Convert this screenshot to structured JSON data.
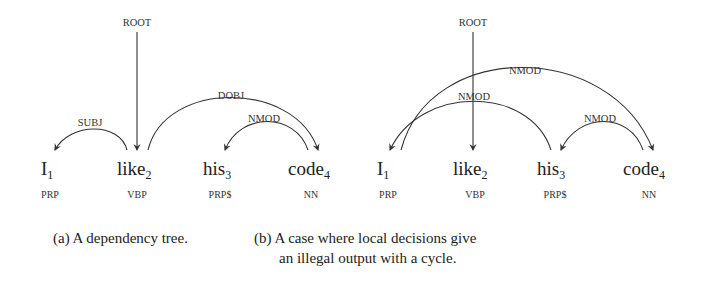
{
  "panel_a": {
    "root_label": "ROOT",
    "arcs": [
      {
        "label": "SUBJ",
        "from": "like",
        "to": "I"
      },
      {
        "label": "DOBJ",
        "from": "like",
        "to": "code"
      },
      {
        "label": "NMOD",
        "from": "code",
        "to": "his"
      }
    ],
    "tokens": [
      {
        "word": "I",
        "index": "1",
        "pos": "PRP"
      },
      {
        "word": "like",
        "index": "2",
        "pos": "VBP"
      },
      {
        "word": "his",
        "index": "3",
        "pos": "PRP$"
      },
      {
        "word": "code",
        "index": "4",
        "pos": "NN"
      }
    ],
    "caption": "(a) A dependency tree."
  },
  "panel_b": {
    "root_label": "ROOT",
    "arcs": [
      {
        "label": "NMOD",
        "from": "I",
        "to": "code"
      },
      {
        "label": "NMOD",
        "from": "his",
        "to": "I"
      },
      {
        "label": "NMOD",
        "from": "code",
        "to": "his"
      }
    ],
    "tokens": [
      {
        "word": "I",
        "index": "1",
        "pos": "PRP"
      },
      {
        "word": "like",
        "index": "2",
        "pos": "VBP"
      },
      {
        "word": "his",
        "index": "3",
        "pos": "PRP$"
      },
      {
        "word": "code",
        "index": "4",
        "pos": "NN"
      }
    ],
    "caption_line1": "(b) A case where local decisions give",
    "caption_line2": "an illegal output with a cycle."
  }
}
